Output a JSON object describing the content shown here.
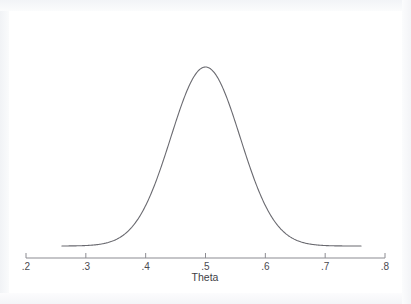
{
  "chart_data": {
    "type": "line",
    "title": "",
    "subtitle": "",
    "xlabel": "Theta",
    "ylabel": "",
    "xlim": [
      0.2,
      0.8
    ],
    "ylim": [
      0,
      1
    ],
    "grid": false,
    "legend": null,
    "legend_position": "none",
    "annotations": [],
    "xticks": [
      ".2",
      ".3",
      ".4",
      ".5",
      ".6",
      ".7",
      ".8"
    ],
    "xtick_values": [
      0.2,
      0.3,
      0.4,
      0.5,
      0.6,
      0.7,
      0.8
    ],
    "yticks": [],
    "series": [
      {
        "name": "Posterior density of Theta",
        "shape": "normal-bell",
        "mean": 0.5,
        "sigma": 0.058,
        "peak_x": 0.5,
        "peak_y": 1.0,
        "x_start": 0.26,
        "x_end": 0.76,
        "color": "#6a6a70",
        "linewidth": 1.1,
        "x": [
          0.26,
          0.28,
          0.3,
          0.32,
          0.34,
          0.36,
          0.38,
          0.4,
          0.42,
          0.44,
          0.46,
          0.48,
          0.5,
          0.52,
          0.54,
          0.56,
          0.58,
          0.6,
          0.62,
          0.64,
          0.66,
          0.68,
          0.7,
          0.72,
          0.74,
          0.76
        ],
        "values": [
          0.001,
          0.002,
          0.005,
          0.011,
          0.024,
          0.048,
          0.09,
          0.156,
          0.25,
          0.371,
          0.508,
          0.645,
          0.76,
          0.833,
          0.852,
          0.81,
          0.718,
          0.597,
          0.466,
          0.34,
          0.232,
          0.147,
          0.087,
          0.048,
          0.025,
          0.012
        ]
      }
    ]
  },
  "axis": {
    "line_color": "#8c8c92",
    "tick_color": "#8c8c92"
  },
  "figure": {
    "background": "#ffffff",
    "page_background": "#fafbfc"
  }
}
